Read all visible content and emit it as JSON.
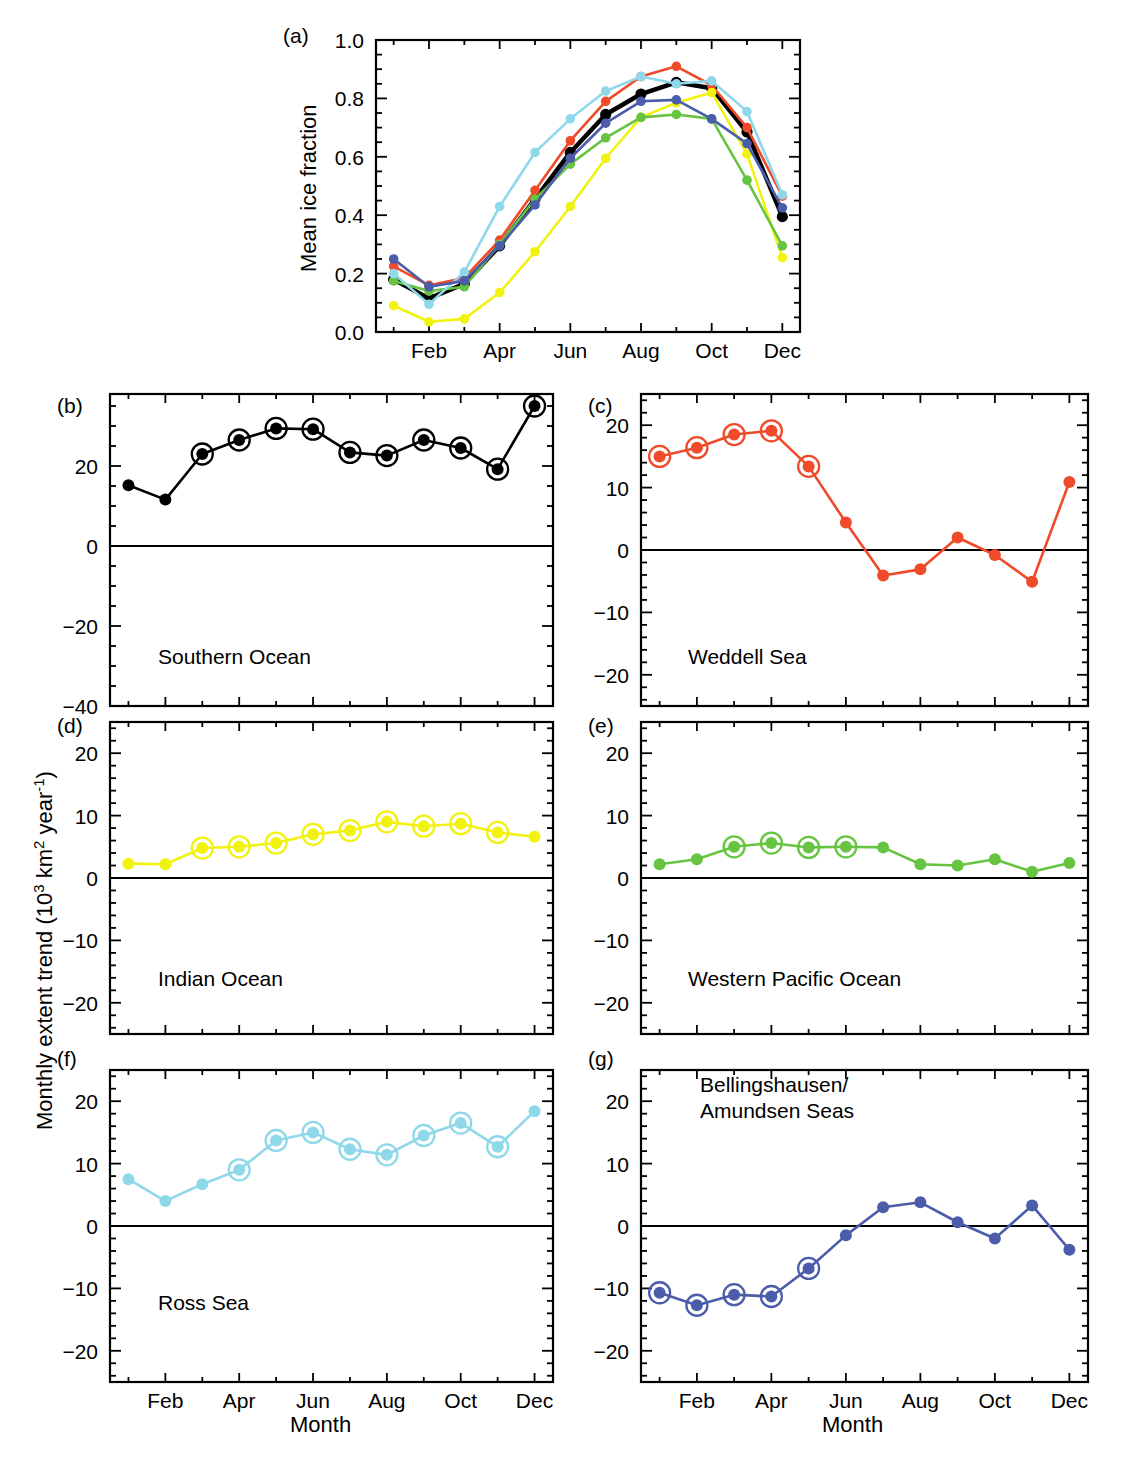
{
  "figure": {
    "y_axis_label_parts": {
      "main": "Monthly extent trend (10",
      "sup1": "3",
      "mid": " km",
      "sup2": "2",
      "mid2": " year",
      "sup3": "-1",
      "end": ")"
    },
    "x_axis_label": "Month",
    "month_ticks": [
      "Feb",
      "Apr",
      "Jun",
      "Aug",
      "Oct",
      "Dec"
    ],
    "month_tick_indices": [
      1,
      3,
      5,
      7,
      9,
      11
    ]
  },
  "colors": {
    "southern_ocean": "#000000",
    "weddell_sea": "#ef4a2a",
    "indian_ocean": "#f2f20f",
    "western_pacific": "#66c441",
    "ross_sea": "#8ed8ea",
    "bellingshausen_amundsen": "#4a5caa",
    "axis": "#000000",
    "zero_line": "#000000",
    "background": "#ffffff"
  },
  "chart_data": [
    {
      "panel": "a",
      "type": "line",
      "title": "",
      "xlabel": "",
      "ylabel": "Mean ice fraction",
      "xlim": [
        0.5,
        12.5
      ],
      "ylim": [
        0.0,
        1.0
      ],
      "yticks": [
        0.0,
        0.2,
        0.4,
        0.6,
        0.8,
        1.0
      ],
      "ytick_labels": [
        "0.0",
        "0.2",
        "0.4",
        "0.6",
        "0.8",
        "1.0"
      ],
      "categories": [
        "Jan",
        "Feb",
        "Mar",
        "Apr",
        "May",
        "Jun",
        "Jul",
        "Aug",
        "Sep",
        "Oct",
        "Nov",
        "Dec"
      ],
      "grid": false,
      "legend": "none",
      "series": [
        {
          "name": "Southern Ocean",
          "color_key": "southern_ocean",
          "width": 4.5,
          "values": [
            0.18,
            0.115,
            0.165,
            0.295,
            0.455,
            0.615,
            0.745,
            0.815,
            0.855,
            0.835,
            0.685,
            0.395
          ]
        },
        {
          "name": "Weddell Sea",
          "color_key": "weddell_sea",
          "width": 2.6,
          "values": [
            0.225,
            0.16,
            0.185,
            0.315,
            0.485,
            0.655,
            0.79,
            0.875,
            0.91,
            0.845,
            0.7,
            0.465
          ]
        },
        {
          "name": "Indian Ocean",
          "color_key": "indian_ocean",
          "width": 2.6,
          "values": [
            0.09,
            0.035,
            0.045,
            0.135,
            0.275,
            0.43,
            0.595,
            0.735,
            0.785,
            0.82,
            0.61,
            0.255
          ]
        },
        {
          "name": "Western Pacific Ocean",
          "color_key": "western_pacific",
          "width": 2.6,
          "values": [
            0.175,
            0.14,
            0.155,
            0.3,
            0.455,
            0.575,
            0.665,
            0.735,
            0.745,
            0.73,
            0.52,
            0.295
          ]
        },
        {
          "name": "Ross Sea",
          "color_key": "ross_sea",
          "width": 2.6,
          "values": [
            0.2,
            0.095,
            0.205,
            0.43,
            0.615,
            0.73,
            0.825,
            0.875,
            0.85,
            0.86,
            0.755,
            0.47
          ]
        },
        {
          "name": "Bellingshausen/Amundsen Seas",
          "color_key": "bellingshausen_amundsen",
          "width": 2.6,
          "values": [
            0.25,
            0.155,
            0.175,
            0.295,
            0.435,
            0.595,
            0.715,
            0.79,
            0.795,
            0.73,
            0.645,
            0.425
          ]
        }
      ]
    },
    {
      "panel": "b",
      "type": "line",
      "title": "Southern Ocean",
      "color_key": "southern_ocean",
      "xlabel": "",
      "ylabel": "Monthly extent trend",
      "xlim": [
        0.5,
        12.5
      ],
      "ylim": [
        -40,
        38
      ],
      "yticks": [
        20,
        0,
        -20,
        -40
      ],
      "ytick_labels": [
        "20",
        "0",
        "-20",
        "-40"
      ],
      "minor_tick_step": 5,
      "categories": [
        "Jan",
        "Feb",
        "Mar",
        "Apr",
        "May",
        "Jun",
        "Jul",
        "Aug",
        "Sep",
        "Oct",
        "Nov",
        "Dec"
      ],
      "values": [
        15.2,
        11.6,
        23.0,
        26.5,
        29.4,
        29.2,
        23.4,
        22.6,
        26.5,
        24.5,
        19.2,
        35.0
      ],
      "significant": [
        false,
        false,
        true,
        true,
        true,
        true,
        true,
        true,
        true,
        true,
        true,
        true
      ],
      "grid": false
    },
    {
      "panel": "c",
      "type": "line",
      "title": "Weddell Sea",
      "color_key": "weddell_sea",
      "xlabel": "",
      "ylabel": "Monthly extent trend",
      "xlim": [
        0.5,
        12.5
      ],
      "ylim": [
        -25,
        25
      ],
      "yticks": [
        20,
        10,
        0,
        -10,
        -20
      ],
      "ytick_labels": [
        "20",
        "10",
        "0",
        "-10",
        "-20"
      ],
      "minor_tick_step": 2,
      "categories": [
        "Jan",
        "Feb",
        "Mar",
        "Apr",
        "May",
        "Jun",
        "Jul",
        "Aug",
        "Sep",
        "Oct",
        "Nov",
        "Dec"
      ],
      "values": [
        15.0,
        16.4,
        18.5,
        19.1,
        13.4,
        4.4,
        -4.1,
        -3.1,
        2.0,
        -0.8,
        -5.1,
        10.9
      ],
      "significant": [
        true,
        true,
        true,
        true,
        true,
        false,
        false,
        false,
        false,
        false,
        false,
        false
      ],
      "grid": false
    },
    {
      "panel": "d",
      "type": "line",
      "title": "Indian Ocean",
      "color_key": "indian_ocean",
      "xlabel": "",
      "ylabel": "Monthly extent trend",
      "xlim": [
        0.5,
        12.5
      ],
      "ylim": [
        -25,
        25
      ],
      "yticks": [
        20,
        10,
        0,
        -10,
        -20
      ],
      "ytick_labels": [
        "20",
        "10",
        "0",
        "-10",
        "-20"
      ],
      "minor_tick_step": 2,
      "categories": [
        "Jan",
        "Feb",
        "Mar",
        "Apr",
        "May",
        "Jun",
        "Jul",
        "Aug",
        "Sep",
        "Oct",
        "Nov",
        "Dec"
      ],
      "values": [
        2.3,
        2.2,
        4.8,
        5.0,
        5.6,
        7.0,
        7.6,
        9.0,
        8.3,
        8.7,
        7.3,
        6.6
      ],
      "significant": [
        false,
        false,
        true,
        true,
        true,
        true,
        true,
        true,
        true,
        true,
        true,
        false
      ],
      "grid": false
    },
    {
      "panel": "e",
      "type": "line",
      "title": "Western Pacific Ocean",
      "color_key": "western_pacific",
      "xlabel": "",
      "ylabel": "Monthly extent trend",
      "xlim": [
        0.5,
        12.5
      ],
      "ylim": [
        -25,
        25
      ],
      "yticks": [
        20,
        10,
        0,
        -10,
        -20
      ],
      "ytick_labels": [
        "20",
        "10",
        "0",
        "-10",
        "-20"
      ],
      "minor_tick_step": 2,
      "categories": [
        "Jan",
        "Feb",
        "Mar",
        "Apr",
        "May",
        "Jun",
        "Jul",
        "Aug",
        "Sep",
        "Oct",
        "Nov",
        "Dec"
      ],
      "values": [
        2.2,
        3.0,
        5.0,
        5.6,
        4.9,
        5.0,
        4.9,
        2.2,
        2.0,
        3.0,
        1.0,
        2.4
      ],
      "significant": [
        false,
        false,
        true,
        true,
        true,
        true,
        false,
        false,
        false,
        false,
        false,
        false
      ],
      "grid": false
    },
    {
      "panel": "f",
      "type": "line",
      "title": "Ross Sea",
      "color_key": "ross_sea",
      "xlabel": "Month",
      "ylabel": "Monthly extent trend",
      "xlim": [
        0.5,
        12.5
      ],
      "ylim": [
        -25,
        25
      ],
      "yticks": [
        20,
        10,
        0,
        -10,
        -20
      ],
      "ytick_labels": [
        "20",
        "10",
        "0",
        "-10",
        "-20"
      ],
      "minor_tick_step": 2,
      "categories": [
        "Jan",
        "Feb",
        "Mar",
        "Apr",
        "May",
        "Jun",
        "Jul",
        "Aug",
        "Sep",
        "Oct",
        "Nov",
        "Dec"
      ],
      "values": [
        7.5,
        4.0,
        6.7,
        9.0,
        13.7,
        15.0,
        12.3,
        11.4,
        14.5,
        16.5,
        12.7,
        18.4
      ],
      "significant": [
        false,
        false,
        false,
        true,
        true,
        true,
        true,
        true,
        true,
        true,
        true,
        false
      ],
      "grid": false
    },
    {
      "panel": "g",
      "type": "line",
      "title": "Bellingshausen/\nAmundsen Seas",
      "color_key": "bellingshausen_amundsen",
      "xlabel": "Month",
      "ylabel": "Monthly extent trend",
      "xlim": [
        0.5,
        12.5
      ],
      "ylim": [
        -25,
        25
      ],
      "yticks": [
        20,
        10,
        0,
        -10,
        -20
      ],
      "ytick_labels": [
        "20",
        "10",
        "0",
        "-10",
        "-20"
      ],
      "minor_tick_step": 2,
      "categories": [
        "Jan",
        "Feb",
        "Mar",
        "Apr",
        "May",
        "Jun",
        "Jul",
        "Aug",
        "Sep",
        "Oct",
        "Nov",
        "Dec"
      ],
      "values": [
        -10.7,
        -12.7,
        -11.0,
        -11.3,
        -6.8,
        -1.5,
        3.0,
        3.8,
        0.6,
        -2.0,
        3.3,
        -3.8
      ],
      "significant": [
        true,
        true,
        true,
        true,
        true,
        false,
        false,
        false,
        false,
        false,
        false,
        false
      ],
      "grid": false
    }
  ],
  "panel_letters": {
    "a": "(a)",
    "b": "(b)",
    "c": "(c)",
    "d": "(d)",
    "e": "(e)",
    "f": "(f)",
    "g": "(g)"
  }
}
